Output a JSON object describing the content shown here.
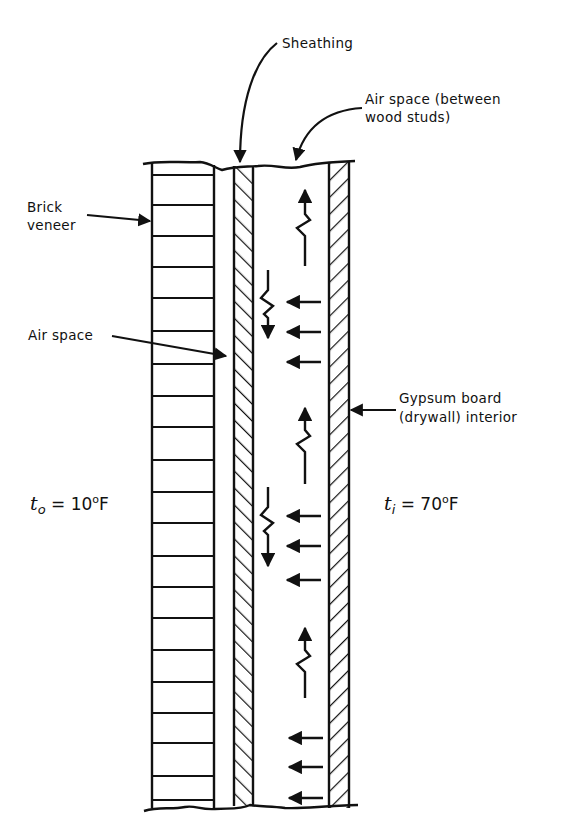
{
  "diagram": {
    "type": "wall cross-section",
    "labels": {
      "sheathing": "Sheathing",
      "air_space_studs_line1": "Air space (between",
      "air_space_studs_line2": "wood studs)",
      "brick_line1": "Brick",
      "brick_line2": "veneer",
      "air_space": "Air space",
      "gypsum_line1": "Gypsum board",
      "gypsum_line2": "(drywall) interior"
    },
    "temperatures": {
      "outside_symbol": "t",
      "outside_sub": "o",
      "outside_value": " = 10",
      "outside_unit": "F",
      "inside_symbol": "t",
      "inside_sub": "i",
      "inside_value": " = 70",
      "inside_unit": "F",
      "degree": "o"
    },
    "layers": [
      "Brick veneer",
      "Air space",
      "Sheathing",
      "Air space (between wood studs)",
      "Gypsum board (drywall) interior"
    ],
    "colors": {
      "ink": "#111111",
      "background": "#ffffff"
    }
  }
}
